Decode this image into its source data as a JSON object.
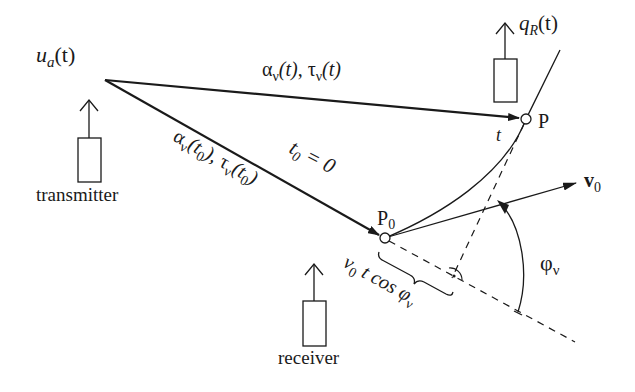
{
  "diagram": {
    "type": "signal-propagation-geometry",
    "labels": {
      "transmitter_signal": {
        "main": "u",
        "sub": "a",
        "arg": "(t)"
      },
      "receiver_signal": {
        "main": "q",
        "sub": "R",
        "arg": "(t)"
      },
      "path_t": {
        "alpha": "α",
        "tau": "τ",
        "sub": "ν",
        "arg": "(t)",
        "sep": ", "
      },
      "path_t0": {
        "alpha": "α",
        "tau": "τ",
        "sub": "ν",
        "arg_open": "(t",
        "arg_sub": "0",
        "arg_close": ")",
        "sep": ", "
      },
      "t0_eq": {
        "main": "t",
        "sub": "0",
        "rest": " = 0"
      },
      "point_P": "P",
      "point_P0": {
        "main": "P",
        "sub": "0"
      },
      "time_t": "t",
      "velocity": {
        "main": "v",
        "sub": "0"
      },
      "angle": {
        "main": "φ",
        "sub": "ν"
      },
      "projection": {
        "v": "v",
        "vsub": "0",
        "rest": " t cos φ",
        "sub": "ν"
      },
      "transmitter": "transmitter",
      "receiver": "receiver"
    },
    "nodes": {
      "source": {
        "x": 105,
        "y": 80
      },
      "P": {
        "x": 526,
        "y": 119
      },
      "P0": {
        "x": 385,
        "y": 238
      },
      "v0_tip": {
        "x": 575,
        "y": 183
      },
      "perp_foot": {
        "x": 455,
        "y": 276
      }
    },
    "colors": {
      "ink": "#1a1a1a",
      "background": "#ffffff"
    }
  }
}
